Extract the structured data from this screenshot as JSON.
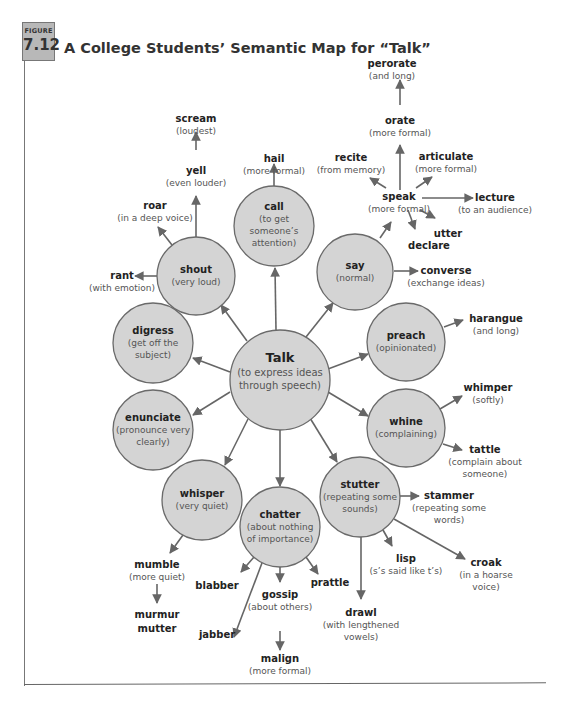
{
  "figure": {
    "label": "Figure",
    "number": "7.12",
    "title": "A College Students’ Semantic Map for “Talk”"
  },
  "colors": {
    "circle_fill": "#d4d4d4",
    "circle_stroke": "#6a6a6a",
    "arrow": "#666666",
    "text": "#222222",
    "subtext": "#555555",
    "badge": "#b8b8b8"
  },
  "center": {
    "word": "Talk",
    "desc": "(to express ideas",
    "desc2": "through speech)"
  },
  "circles": [
    {
      "id": "shout",
      "word": "shout",
      "desc": "(very loud)",
      "desc2": "",
      "desc3": ""
    },
    {
      "id": "call",
      "word": "call",
      "desc": "(to get",
      "desc2": "someone’s",
      "desc3": "attention)"
    },
    {
      "id": "say",
      "word": "say",
      "desc": "(normal)",
      "desc2": "",
      "desc3": ""
    },
    {
      "id": "digress",
      "word": "digress",
      "desc": "(get off the",
      "desc2": "subject)",
      "desc3": ""
    },
    {
      "id": "preach",
      "word": "preach",
      "desc": "(opinionated)",
      "desc2": "",
      "desc3": ""
    },
    {
      "id": "enunciate",
      "word": "enunciate",
      "desc": "(pronounce very",
      "desc2": "clearly)",
      "desc3": ""
    },
    {
      "id": "whine",
      "word": "whine",
      "desc": "(complaining)",
      "desc2": "",
      "desc3": ""
    },
    {
      "id": "whisper",
      "word": "whisper",
      "desc": "(very quiet)",
      "desc2": "",
      "desc3": ""
    },
    {
      "id": "chatter",
      "word": "chatter",
      "desc": "(about nothing",
      "desc2": "of importance)",
      "desc3": ""
    },
    {
      "id": "stutter",
      "word": "stutter",
      "desc": "(repeating some",
      "desc2": "sounds)",
      "desc3": ""
    }
  ],
  "leaves": {
    "scream": {
      "word": "scream",
      "desc": "(loudest)"
    },
    "yell": {
      "word": "yell",
      "desc": "(even louder)"
    },
    "roar": {
      "word": "roar",
      "desc": "(in a deep voice)"
    },
    "rant": {
      "word": "rant",
      "desc": "(with emotion)"
    },
    "hail": {
      "word": "hail",
      "desc": "(more formal)"
    },
    "perorate": {
      "word": "perorate",
      "desc": "(and long)"
    },
    "orate": {
      "word": "orate",
      "desc": "(more formal)"
    },
    "recite": {
      "word": "recite",
      "desc": "(from memory)"
    },
    "articulate": {
      "word": "articulate",
      "desc": "(more formal)"
    },
    "speak": {
      "word": "speak",
      "desc": "(more formal)"
    },
    "lecture": {
      "word": "lecture",
      "desc": "(to an audience)"
    },
    "utter": {
      "word": "utter",
      "desc": ""
    },
    "declare": {
      "word": "declare",
      "desc": ""
    },
    "converse": {
      "word": "converse",
      "desc": "(exchange ideas)"
    },
    "harangue": {
      "word": "harangue",
      "desc": "(and long)"
    },
    "whimper": {
      "word": "whimper",
      "desc": "(softly)"
    },
    "tattle": {
      "word": "tattle",
      "desc": "(complain about",
      "desc2": "someone)"
    },
    "stammer": {
      "word": "stammer",
      "desc": "(repeating some",
      "desc2": "words)"
    },
    "lisp": {
      "word": "lisp",
      "desc": "(s’s said like t’s)"
    },
    "croak": {
      "word": "croak",
      "desc": "(in a hoarse",
      "desc2": "voice)"
    },
    "drawl": {
      "word": "drawl",
      "desc": "(with lengthened",
      "desc2": "vowels)"
    },
    "prattle": {
      "word": "prattle",
      "desc": ""
    },
    "gossip": {
      "word": "gossip",
      "desc": "(about others)"
    },
    "malign": {
      "word": "malign",
      "desc": "(more formal)"
    },
    "blabber": {
      "word": "blabber",
      "desc": ""
    },
    "jabber": {
      "word": "jabber",
      "desc": ""
    },
    "mumble": {
      "word": "mumble",
      "desc": "(more quiet)"
    },
    "murmur": {
      "word": "murmur",
      "desc": ""
    },
    "mutter": {
      "word": "mutter",
      "desc": ""
    }
  }
}
